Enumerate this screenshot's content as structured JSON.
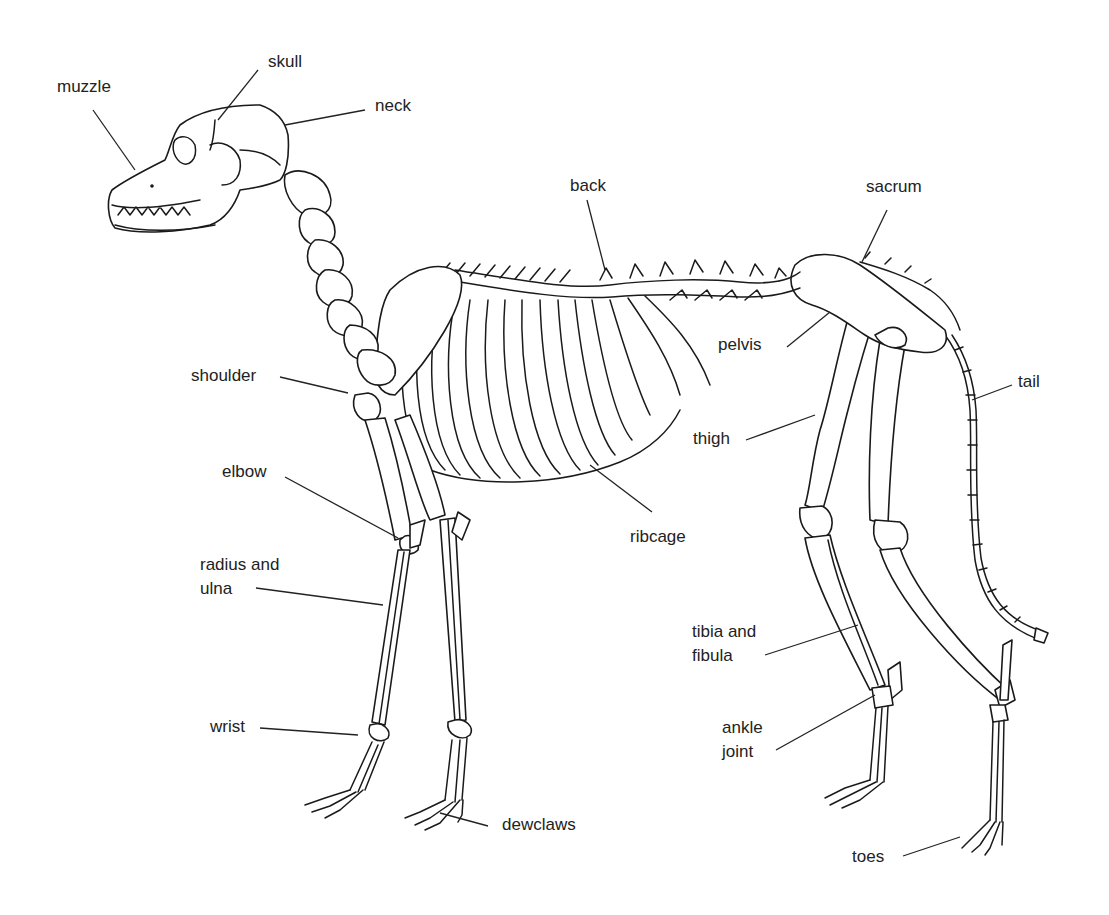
{
  "diagram": {
    "labels": {
      "muzzle": "muzzle",
      "skull": "skull",
      "neck": "neck",
      "back": "back",
      "sacrum": "sacrum",
      "pelvis": "pelvis",
      "tail": "tail",
      "shoulder": "shoulder",
      "thigh": "thigh",
      "elbow": "elbow",
      "ribcage": "ribcage",
      "radius_ulna_1": "radius and",
      "radius_ulna_2": "ulna",
      "tibia_fibula_1": "tibia and",
      "tibia_fibula_2": "fibula",
      "wrist": "wrist",
      "ankle_1": "ankle",
      "ankle_2": "joint",
      "dewclaws": "dewclaws",
      "toes": "toes"
    },
    "colors": {
      "line": "#1a1a1a",
      "text": "#222222",
      "background": "#ffffff"
    }
  }
}
